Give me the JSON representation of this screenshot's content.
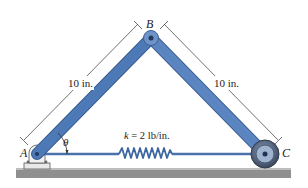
{
  "figure": {
    "points": {
      "A": {
        "label": "A",
        "x": 37,
        "y": 154
      },
      "B": {
        "label": "B",
        "x": 151,
        "y": 38
      },
      "C": {
        "label": "C",
        "x": 265,
        "y": 154
      }
    },
    "members": [
      {
        "from": "A",
        "to": "B",
        "length_label": "10 in."
      },
      {
        "from": "B",
        "to": "C",
        "length_label": "10 in."
      }
    ],
    "spring": {
      "label": "k = 2 lb/in.",
      "k_symbol": "k",
      "k_value": "= 2 lb/in."
    },
    "angle": {
      "symbol": "θ",
      "at": "A"
    },
    "colors": {
      "member": "#5b86c2",
      "member_dark": "#3a5f95",
      "member_light": "#a9c3e6",
      "ground": "#8c8c8c",
      "ground_top": "#b5b5b5",
      "roller": "#4b5a70",
      "dim_line": "#333333"
    }
  }
}
